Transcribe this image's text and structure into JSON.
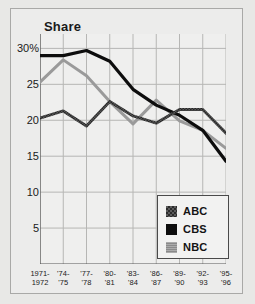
{
  "chart_data": {
    "type": "line",
    "title": "Share",
    "xlabel": "",
    "ylabel": "",
    "ylim": [
      0,
      32
    ],
    "yticks": [
      5,
      10,
      15,
      20,
      25,
      30
    ],
    "ytick_labels": [
      "5",
      "10",
      "15",
      "20",
      "25",
      "30%"
    ],
    "grid": true,
    "legend_position": "bottom-right",
    "categories": [
      "1971-1972",
      "'74-'75",
      "'77-'78",
      "'80-'81",
      "'83-'84",
      "'86-'87",
      "'89-'90",
      "'92-'93",
      "'95-'96"
    ],
    "xtick_lines": [
      [
        "1971-",
        "1972"
      ],
      [
        "'74-",
        "'75"
      ],
      [
        "'77-",
        "'78"
      ],
      [
        "'80-",
        "'81"
      ],
      [
        "'83-",
        "'84"
      ],
      [
        "'86-",
        "'87"
      ],
      [
        "'89-",
        "'90"
      ],
      [
        "'92-",
        "'93"
      ],
      [
        "'95-",
        "'96"
      ]
    ],
    "series": [
      {
        "name": "ABC",
        "color": "#4a4a4a",
        "values": [
          20.3,
          21.3,
          19.2,
          22.6,
          20.6,
          19.6,
          21.5,
          21.5,
          18.2
        ]
      },
      {
        "name": "CBS",
        "color": "#0d0d0d",
        "values": [
          29.0,
          29.0,
          29.7,
          28.2,
          24.3,
          22.1,
          20.7,
          18.6,
          14.3
        ]
      },
      {
        "name": "NBC",
        "color": "#9a9a9a",
        "values": [
          25.3,
          28.4,
          26.2,
          22.6,
          19.5,
          22.8,
          19.9,
          18.6,
          16.1
        ]
      }
    ]
  },
  "legend": {
    "entries": [
      {
        "label": "ABC",
        "swatch": "abc-swatch"
      },
      {
        "label": "CBS",
        "swatch": "cbs-swatch"
      },
      {
        "label": "NBC",
        "swatch": "nbc-swatch"
      }
    ]
  }
}
